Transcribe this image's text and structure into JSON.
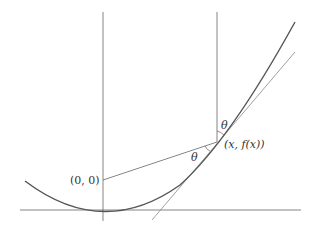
{
  "diagram": {
    "labels": {
      "origin": "(0, 0)",
      "point": "(x, f(x))",
      "theta_top": "θ",
      "theta_left": "θ"
    },
    "colors": {
      "curve": "#555555",
      "lines": "#666666",
      "tangent": "#888888",
      "text": "#333333"
    }
  }
}
